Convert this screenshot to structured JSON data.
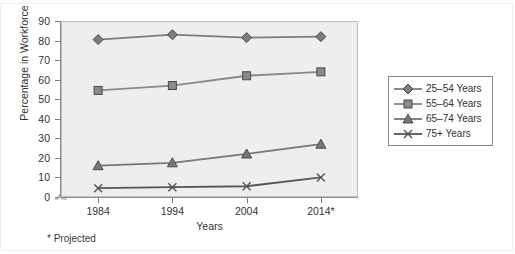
{
  "chart_data": {
    "type": "line",
    "title": "",
    "xlabel": "Years",
    "ylabel": "Percentage in Workforce",
    "categories": [
      "1984",
      "1994",
      "2004",
      "2014*"
    ],
    "x": [
      1984,
      1994,
      2004,
      2014
    ],
    "ylim": [
      0,
      90
    ],
    "ytick_step": 10,
    "yticks": [
      0,
      10,
      20,
      30,
      40,
      50,
      60,
      70,
      80,
      90
    ],
    "grid": false,
    "axis_break": true,
    "legend_position": "right",
    "footnote": "* Projected",
    "series": [
      {
        "name": "25–54 Years",
        "marker": "diamond",
        "color": "#7d7d7d",
        "values": [
          80.5,
          83.0,
          81.5,
          82.0
        ]
      },
      {
        "name": "55–64 Years",
        "marker": "square",
        "color": "#8a8a8a",
        "values": [
          54.5,
          57.0,
          62.0,
          64.0
        ]
      },
      {
        "name": "65–74 Years",
        "marker": "triangle",
        "color": "#787878",
        "values": [
          16.0,
          17.5,
          22.0,
          27.0
        ]
      },
      {
        "name": "75+ Years",
        "marker": "x",
        "color": "#555555",
        "values": [
          4.5,
          5.0,
          5.5,
          10.0
        ]
      }
    ]
  },
  "axis": {
    "y_title": "Percentage in Workforce",
    "x_title": "Years",
    "y_labels": [
      "90",
      "80",
      "70",
      "60",
      "50",
      "40",
      "30",
      "20",
      "10",
      "0"
    ],
    "x_labels": [
      "1984",
      "1994",
      "2004",
      "2014*"
    ]
  },
  "legend": {
    "items": [
      {
        "label": "25–54 Years"
      },
      {
        "label": "55–64 Years"
      },
      {
        "label": "65–74 Years"
      },
      {
        "label": "75+ Years"
      }
    ]
  },
  "notes": {
    "projected": "* Projected"
  },
  "colors": {
    "plot_background": "#eeeeee",
    "plot_border": "#bdbdbd",
    "axis": "#8f8f8f",
    "text": "#333333",
    "series_1": "#7d7d7d",
    "series_2": "#8a8a8a",
    "series_3": "#787878",
    "series_4": "#555555"
  }
}
